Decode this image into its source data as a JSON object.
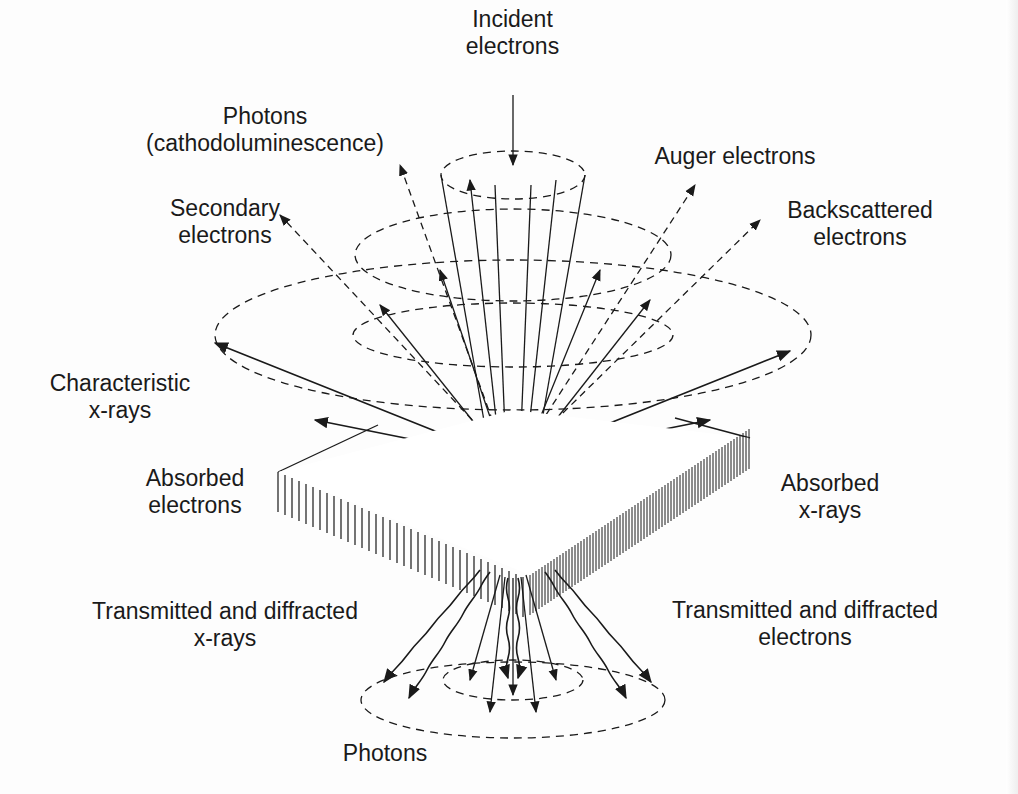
{
  "figure": {
    "labels": {
      "incident_electrons": [
        "Incident",
        "electrons"
      ],
      "photons_cl": [
        "Photons",
        "(cathodoluminescence)"
      ],
      "auger_electrons": [
        "Auger electrons"
      ],
      "secondary_electrons": [
        "Secondary",
        "electrons"
      ],
      "backscattered_electrons": [
        "Backscattered",
        "electrons"
      ],
      "characteristic_xrays": [
        "Characteristic",
        "x-rays"
      ],
      "absorbed_electrons": [
        "Absorbed",
        "electrons"
      ],
      "absorbed_xrays": [
        "Absorbed",
        "x-rays"
      ],
      "transmitted_xrays": [
        "Transmitted and diffracted",
        "x-rays"
      ],
      "transmitted_electrons": [
        "Transmitted and diffracted",
        "electrons"
      ],
      "photons_bottom": [
        "Photons"
      ]
    },
    "colors": {
      "ink": "#1a1a1a",
      "background": "#fdfdfd"
    }
  }
}
